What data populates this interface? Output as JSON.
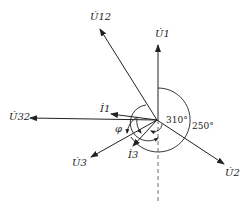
{
  "diagram": {
    "type": "phasor diagram",
    "colors": {
      "line": "#222222",
      "background": "#ffffff"
    },
    "phasors": [
      {
        "id": "U12",
        "base": "U",
        "sub": "12",
        "dot": true,
        "label": "U̇12"
      },
      {
        "id": "U1",
        "base": "U",
        "sub": "1",
        "dot": true,
        "label": "U̇1"
      },
      {
        "id": "U32",
        "base": "U",
        "sub": "32",
        "dot": true,
        "label": "U̇32"
      },
      {
        "id": "I1",
        "base": "I",
        "sub": "1",
        "dot": true,
        "label": "İ1"
      },
      {
        "id": "U3",
        "base": "U",
        "sub": "3",
        "dot": true,
        "label": "U̇3"
      },
      {
        "id": "I3",
        "base": "I",
        "sub": "3",
        "dot": true,
        "label": "İ3"
      },
      {
        "id": "U2",
        "base": "U",
        "sub": "2",
        "dot": true,
        "label": "U̇2"
      }
    ],
    "angles": {
      "a310": "310°",
      "a250": "250°",
      "phi": "φ"
    }
  }
}
